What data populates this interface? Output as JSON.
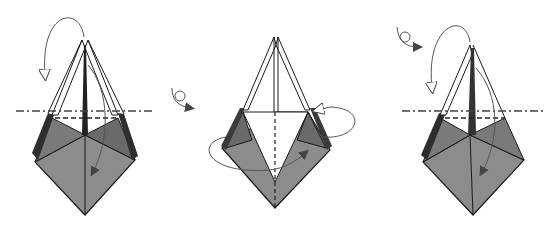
{
  "diagram": {
    "type": "origami-fold-sequence",
    "steps": [
      {
        "id": 1,
        "description": "Valley fold top flap down along line; mountain fold back flap behind",
        "symbols": [
          "valley-fold-line",
          "mountain-fold-line",
          "fold-behind-arrow",
          "fold-forward-arrow"
        ]
      },
      {
        "id": 2,
        "description": "Turn model over; fold side flaps in",
        "symbols": [
          "turn-over-icon",
          "valley-fold-line",
          "fold-arrows"
        ]
      },
      {
        "id": 3,
        "description": "Turn model over; repeat folds on this side",
        "symbols": [
          "turn-over-icon",
          "valley-fold-line",
          "mountain-fold-line",
          "fold-arrows"
        ]
      }
    ],
    "colors": {
      "paper_dark": "#8a8a8a",
      "paper_darker": "#5a5a5a",
      "paper_darkest": "#2e2e2e",
      "paper_white": "#ffffff",
      "line": "#1a1a1a",
      "arrow": "#555555"
    }
  }
}
